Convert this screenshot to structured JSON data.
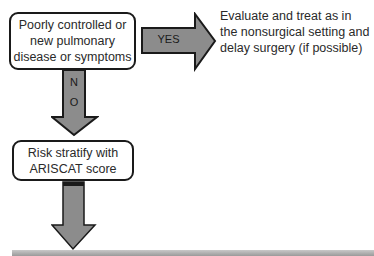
{
  "flowchart": {
    "box1": {
      "text": "Poorly controlled or new pulmonary disease or symptoms"
    },
    "yes_arrow": {
      "label": "YES"
    },
    "outcome_yes": {
      "text": "Evaluate and treat as in the nonsurgical setting and delay surgery (if possible)"
    },
    "no_arrow": {
      "label_n": "N",
      "label_o": "O"
    },
    "box2": {
      "text": "Risk stratify with ARISCAT score"
    },
    "colors": {
      "arrow_fill": "#8c8c8c",
      "arrow_stroke": "#1a1a1a",
      "box_border": "#1a1a1a",
      "text": "#2a2a2a"
    }
  }
}
